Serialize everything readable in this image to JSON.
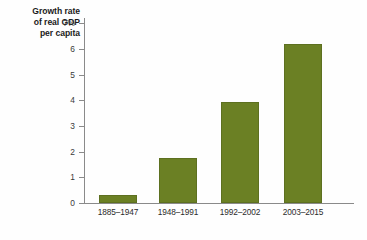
{
  "chart_data": {
    "type": "bar",
    "title": "",
    "ylabel": "Growth rate of real GDP per capita",
    "ylabel_lines": [
      "Growth rate",
      "of real GDP",
      "per capita"
    ],
    "xlabel": "",
    "categories": [
      "1885–1947",
      "1948–1991",
      "1992–2002",
      "2003–2015"
    ],
    "values": [
      0.3,
      1.75,
      3.95,
      6.2
    ],
    "series": [
      {
        "name": "Growth rate of real GDP per capita",
        "values": [
          0.3,
          1.75,
          3.95,
          6.2
        ]
      }
    ],
    "ylim": [
      0,
      7
    ],
    "yticks": [
      0,
      1,
      2,
      3,
      4,
      5,
      6,
      7
    ],
    "ytick_labels": [
      "0",
      "1",
      "2",
      "3",
      "4",
      "5",
      "6",
      "7%"
    ],
    "grid": false,
    "legend": null,
    "bar_color": "#6b8024",
    "axis_color": "#8a8a8a",
    "background": "#fefefe"
  }
}
